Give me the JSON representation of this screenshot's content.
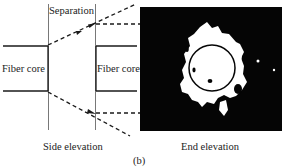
{
  "figure": {
    "caption": "(b)",
    "labels": {
      "separation": "Separation",
      "left_core": "Fiber core",
      "right_core": "Fiber core",
      "side_elevation": "Side elevation",
      "end_elevation": "End elevation"
    },
    "colors": {
      "line": "#1a1a1a",
      "end_view_bg": "#050505",
      "light_spot": "#ffffff"
    }
  }
}
